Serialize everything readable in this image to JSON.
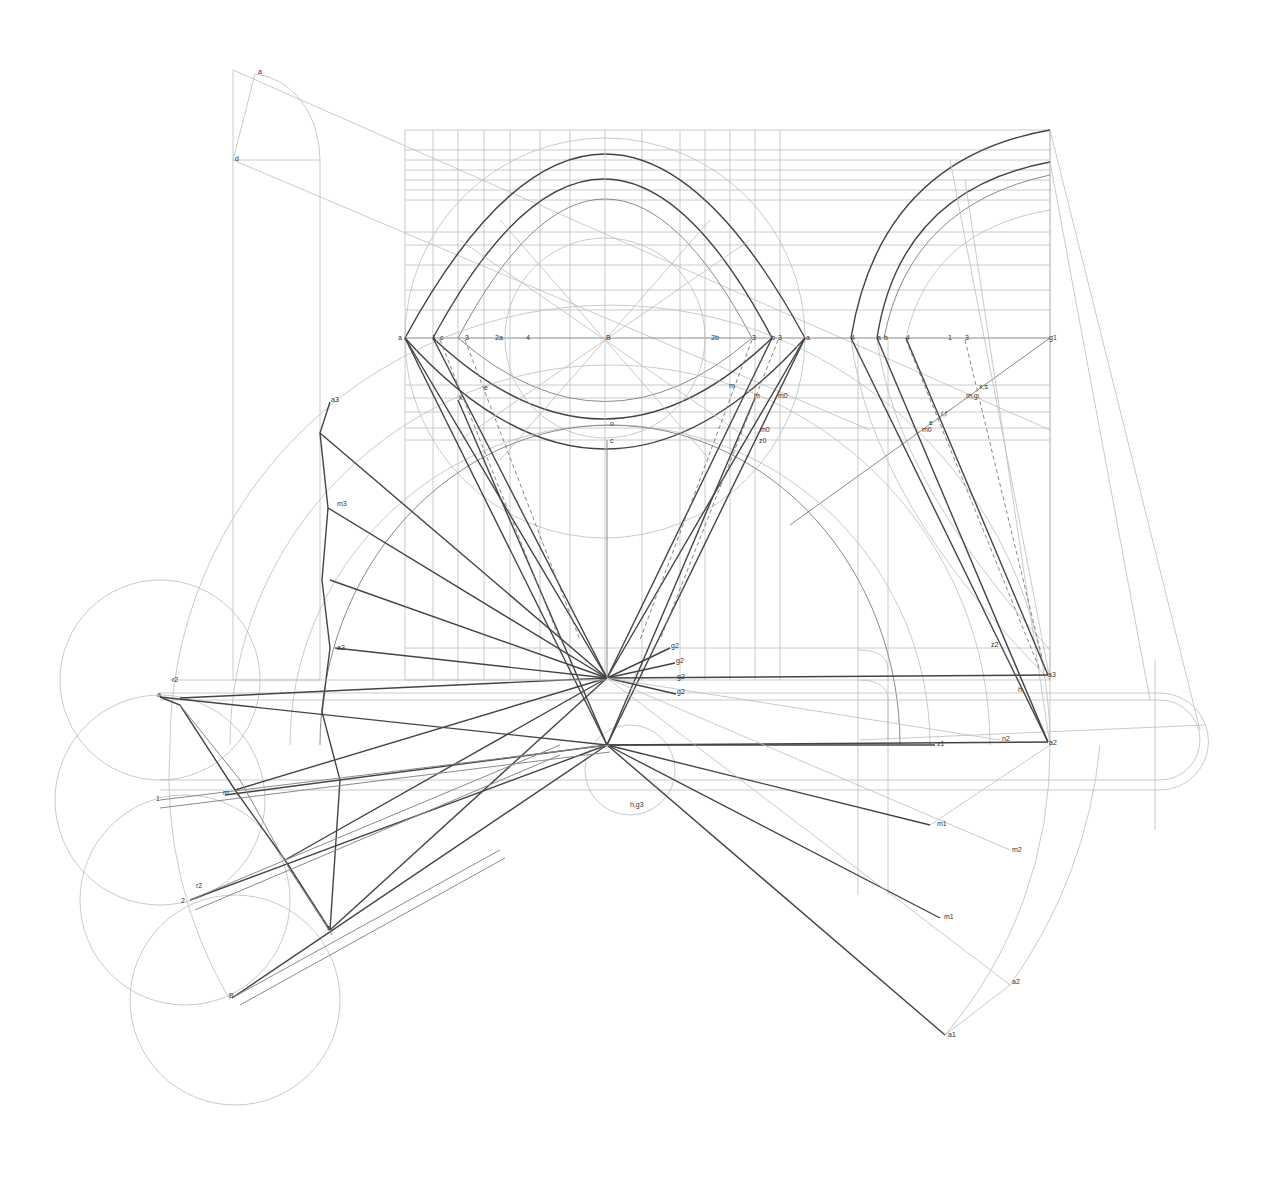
{
  "drawing": {
    "colors": {
      "background": "#ffffff",
      "thin": "#bdbdbd",
      "mid": "#8a8a8a",
      "bold": "#444444",
      "label": "#333333"
    },
    "labels": [
      {
        "t": "a",
        "x": 258,
        "y": 74
      },
      {
        "t": "d",
        "x": 235,
        "y": 161
      },
      {
        "t": "a",
        "x": 398,
        "y": 340
      },
      {
        "t": "1",
        "x": 432,
        "y": 340
      },
      {
        "t": "c",
        "x": 440,
        "y": 340
      },
      {
        "t": "3",
        "x": 465,
        "y": 340
      },
      {
        "t": "2a",
        "x": 495,
        "y": 340
      },
      {
        "t": "4",
        "x": 526,
        "y": 340
      },
      {
        "t": "B",
        "x": 606,
        "y": 340
      },
      {
        "t": "2b",
        "x": 711,
        "y": 340
      },
      {
        "t": "3",
        "x": 752,
        "y": 340
      },
      {
        "t": "b",
        "x": 771,
        "y": 340
      },
      {
        "t": "3",
        "x": 778,
        "y": 340
      },
      {
        "t": "a",
        "x": 806,
        "y": 340
      },
      {
        "t": "4",
        "x": 851,
        "y": 340
      },
      {
        "t": "a",
        "x": 877,
        "y": 340
      },
      {
        "t": "b",
        "x": 884,
        "y": 340
      },
      {
        "t": "4",
        "x": 906,
        "y": 340
      },
      {
        "t": "1",
        "x": 948,
        "y": 340
      },
      {
        "t": "3",
        "x": 965,
        "y": 340
      },
      {
        "t": "g1",
        "x": 1049,
        "y": 340
      },
      {
        "t": "x,s",
        "x": 979,
        "y": 389
      },
      {
        "t": "m,g",
        "x": 966,
        "y": 398
      },
      {
        "t": "r,f",
        "x": 941,
        "y": 416
      },
      {
        "t": "e",
        "x": 929,
        "y": 425
      },
      {
        "t": "m0",
        "x": 922,
        "y": 432
      },
      {
        "t": "e",
        "x": 484,
        "y": 390
      },
      {
        "t": "k",
        "x": 459,
        "y": 400
      },
      {
        "t": "m",
        "x": 729,
        "y": 388
      },
      {
        "t": "m",
        "x": 754,
        "y": 398
      },
      {
        "t": "m0",
        "x": 778,
        "y": 398
      },
      {
        "t": "o",
        "x": 610,
        "y": 426
      },
      {
        "t": "m0",
        "x": 760,
        "y": 432
      },
      {
        "t": "z0",
        "x": 759,
        "y": 443
      },
      {
        "t": "c",
        "x": 610,
        "y": 443
      },
      {
        "t": "a3",
        "x": 331,
        "y": 402
      },
      {
        "t": "m3",
        "x": 337,
        "y": 506
      },
      {
        "t": "a3",
        "x": 337,
        "y": 650
      },
      {
        "t": "r2",
        "x": 172,
        "y": 682
      },
      {
        "t": "a",
        "x": 157,
        "y": 697
      },
      {
        "t": "m",
        "x": 223,
        "y": 795
      },
      {
        "t": "1",
        "x": 156,
        "y": 801
      },
      {
        "t": "r2",
        "x": 196,
        "y": 888
      },
      {
        "t": "2",
        "x": 181,
        "y": 903
      },
      {
        "t": "s",
        "x": 327,
        "y": 930
      },
      {
        "t": "B",
        "x": 229,
        "y": 998
      },
      {
        "t": "g2",
        "x": 671,
        "y": 648
      },
      {
        "t": "g2",
        "x": 676,
        "y": 663
      },
      {
        "t": "g2",
        "x": 677,
        "y": 679
      },
      {
        "t": "g2",
        "x": 677,
        "y": 694
      },
      {
        "t": "h,g3",
        "x": 630,
        "y": 807
      },
      {
        "t": "z2",
        "x": 991,
        "y": 647
      },
      {
        "t": "a3",
        "x": 1048,
        "y": 677
      },
      {
        "t": "h",
        "x": 1018,
        "y": 692
      },
      {
        "t": "z1",
        "x": 937,
        "y": 746
      },
      {
        "t": "n2",
        "x": 1002,
        "y": 741
      },
      {
        "t": "a2",
        "x": 1049,
        "y": 745
      },
      {
        "t": "m1",
        "x": 937,
        "y": 826
      },
      {
        "t": "m2",
        "x": 1012,
        "y": 852
      },
      {
        "t": "m1",
        "x": 944,
        "y": 919
      },
      {
        "t": "a2",
        "x": 1012,
        "y": 984
      },
      {
        "t": "a1",
        "x": 948,
        "y": 1037
      }
    ]
  }
}
